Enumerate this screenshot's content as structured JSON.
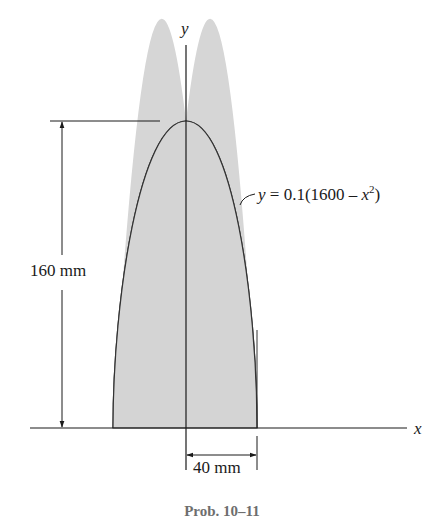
{
  "figure": {
    "axis_x_label": "x",
    "axis_y_label": "y",
    "equation": {
      "prefix": "y",
      "eq": " = 0.1(1600 – ",
      "var": "x",
      "exp": "2",
      "suffix": ")"
    },
    "height_dimension": "160 mm",
    "half_width_dimension": "40 mm",
    "caption": "Prob. 10–11",
    "fill_color": "#d4d4d4",
    "line_color": "#1a1a1a"
  }
}
